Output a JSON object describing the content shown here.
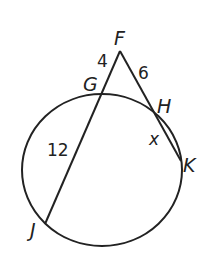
{
  "diagram": {
    "type": "circle-secants",
    "stroke_color": "#222222",
    "background": "#ffffff",
    "circle": {
      "cx": 102,
      "cy": 170,
      "rx": 80,
      "ry": 76
    },
    "points": {
      "F": {
        "label": "F",
        "x": 120,
        "y": 51
      },
      "G": {
        "label": "G",
        "x": 102,
        "y": 95
      },
      "H": {
        "label": "H",
        "x": 153,
        "y": 112
      },
      "K": {
        "label": "K",
        "x": 181,
        "y": 161
      },
      "J": {
        "label": "J",
        "x": 45,
        "y": 224
      }
    },
    "segments": [
      {
        "from": "F",
        "to": "J"
      },
      {
        "from": "F",
        "to": "K"
      }
    ],
    "measures": {
      "FG": "4",
      "FH": "6",
      "GJ": "12",
      "HK": "x"
    }
  }
}
